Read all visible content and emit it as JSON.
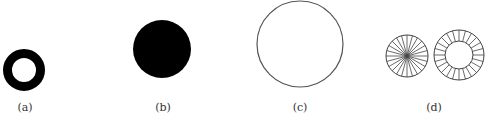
{
  "figure": {
    "panels": [
      {
        "id": "a",
        "label": "(a)",
        "shape": "thick-ring",
        "color": "#000000"
      },
      {
        "id": "b",
        "label": "(b)",
        "shape": "filled-disk",
        "color": "#000000"
      },
      {
        "id": "c",
        "label": "(c)",
        "shape": "outline-circle",
        "color": "#555555"
      },
      {
        "id": "d",
        "label": "(d)",
        "shape": "spoked-circle-and-spoked-ring",
        "color": "#444444",
        "spoke_count": 24
      }
    ]
  }
}
